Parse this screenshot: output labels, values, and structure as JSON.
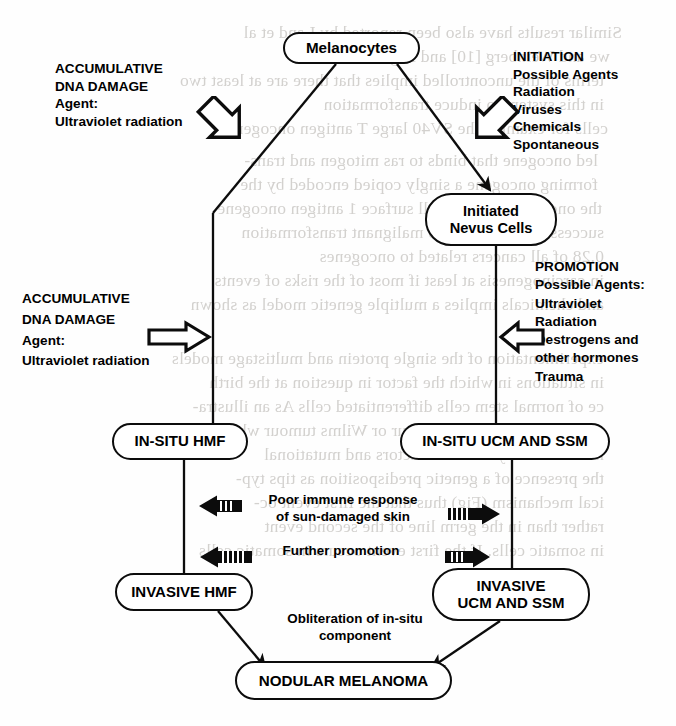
{
  "document": {
    "type": "scanned-textbook-figure",
    "title": "Melanocyte tumour progression flow diagram",
    "ink_color": "#0c0c0c",
    "paper_color": "#fefefe",
    "bleed_color": "#b9b6b2"
  },
  "nodes": {
    "melanocytes": {
      "label": "Melanocytes"
    },
    "initiated_nevus": {
      "line1": "Initiated",
      "line2": "Nevus Cells"
    },
    "insitu_hmf": {
      "label": "IN-SITU HMF"
    },
    "insitu_ucm_ssm": {
      "label": "IN-SITU UCM AND SSM"
    },
    "invasive_hmf": {
      "label": "INVASIVE HMF"
    },
    "invasive_ucm_ssm": {
      "line1": "INVASIVE",
      "line2": "UCM AND SSM"
    },
    "nodular_melanoma": {
      "label": "NODULAR MELANOMA"
    }
  },
  "annotations": {
    "accumulative_top": {
      "line1": "ACCUMULATIVE",
      "line2": "DNA DAMAGE",
      "line3": "Agent:",
      "line4": "Ultraviolet radiation"
    },
    "initiation": {
      "line1": "INITIATION",
      "line2": "Possible Agents",
      "line3": "Radiation",
      "line4": "Viruses",
      "line5": "Chemicals",
      "line6": "Spontaneous"
    },
    "accumulative_bottom": {
      "line1": "ACCUMULATIVE",
      "line2": "DNA DAMAGE",
      "line3": "Agent:",
      "line4": "Ultraviolet radiation"
    },
    "promotion": {
      "line1": "PROMOTION",
      "line2": "Possible Agents:",
      "line3": "Ultraviolet",
      "line4": "Radiation",
      "line5": "Oestrogens and",
      "line6": "other hormones",
      "line7": "Trauma"
    },
    "poor_immune": {
      "line1": "Poor immune response",
      "line2": "of sun-damaged skin"
    },
    "further_promotion": {
      "line1": "Further promotion"
    },
    "obliteration": {
      "line1": "Obliteration of in-situ",
      "line2": "component"
    }
  },
  "bleed_through_text": [
    {
      "x": 62,
      "y": 22,
      "text": "Similar results have also been reported by Land et al",
      "mirror": true
    },
    {
      "x": 50,
      "y": 46,
      "text": "we and Weinberg [10] and Bigaretti et al",
      "mirror": true
    },
    {
      "x": 44,
      "y": 70,
      "text": "terms of the uncontrolled implies that there are at least two",
      "mirror": true
    },
    {
      "x": 44,
      "y": 94,
      "text": "in this system to induce transformation",
      "mirror": true
    },
    {
      "x": 48,
      "y": 118,
      "text": "cells for example the SV40 large T antigen oncogene",
      "mirror": true
    },
    {
      "x": 38,
      "y": 150,
      "text": "led oncogene that binds to ras mitogen and trans-",
      "mirror": true
    },
    {
      "x": 38,
      "y": 174,
      "text": "forming oncogene a singly copied encoded by the",
      "mirror": true
    },
    {
      "x": 42,
      "y": 198,
      "text": "the oncogene like the cell surface 1 antigen oncogene",
      "mirror": true
    },
    {
      "x": 44,
      "y": 222,
      "text": "successful conversion to malignant transformation",
      "mirror": true
    },
    {
      "x": 44,
      "y": 246,
      "text": "0.28 of all cancers related to oncogenes",
      "mirror": true
    },
    {
      "x": 44,
      "y": 270,
      "text": "in carcinogenesis at least if most of the risks of events",
      "mirror": true
    },
    {
      "x": 44,
      "y": 294,
      "text": "and chemicals implies a multiple genetic model as shown",
      "mirror": true
    },
    {
      "x": 44,
      "y": 348,
      "text": "experimentation of the single protein and multistage models",
      "mirror": true
    },
    {
      "x": 44,
      "y": 372,
      "text": "in situations in which the factor in question at the birth",
      "mirror": true
    },
    {
      "x": 44,
      "y": 396,
      "text": "ce of normal stem cells differentiated cells As an illustra-",
      "mirror": true
    },
    {
      "x": 44,
      "y": 420,
      "text": "tumours such as renal tumour or Wilms tumour which are",
      "mirror": true
    },
    {
      "x": 44,
      "y": 444,
      "text": "not necessarily for these factors and mutational",
      "mirror": true
    },
    {
      "x": 44,
      "y": 468,
      "text": "the presence of a genetic predisposition as tips typ-",
      "mirror": true
    },
    {
      "x": 44,
      "y": 492,
      "text": "ical mechanism (Fig) thus that the first event oc-",
      "mirror": true
    },
    {
      "x": 44,
      "y": 516,
      "text": "rather than in the germ line of the second event",
      "mirror": true
    },
    {
      "x": 44,
      "y": 540,
      "text": "in somatic cells. If the first event occurs in somatic cells",
      "mirror": true
    }
  ]
}
